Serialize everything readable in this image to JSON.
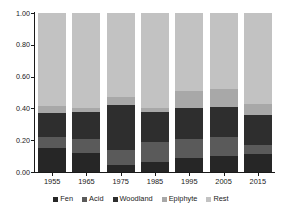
{
  "chart_data": {
    "type": "bar",
    "subtype": "stacked-bar-proportional",
    "title": "",
    "subtitle": "",
    "xlabel": "",
    "ylabel": "",
    "categories": [
      "1955",
      "1965",
      "1975",
      "1985",
      "1995",
      "2005",
      "2015"
    ],
    "xtick_labels": [
      "1955",
      "1965",
      "1975",
      "1985",
      "1995",
      "2005",
      "2015"
    ],
    "ytick_labels": [
      "0.00",
      "0.20",
      "0.40",
      "0.60",
      "0.80",
      "1.00"
    ],
    "ytick_values": [
      0.0,
      0.2,
      0.4,
      0.6,
      0.8,
      1.0
    ],
    "ylim": [
      0.0,
      1.0
    ],
    "grid": false,
    "legend_position": "bottom",
    "stack_order_bottom_to_top": [
      "Fen",
      "Acid",
      "Woodland",
      "Epiphyte",
      "Rest"
    ],
    "series": [
      {
        "name": "Fen",
        "color": "#262626",
        "values": [
          0.15,
          0.12,
          0.045,
          0.065,
          0.09,
          0.1,
          0.115
        ]
      },
      {
        "name": "Acid",
        "color": "#5a5a5a",
        "values": [
          0.07,
          0.09,
          0.095,
          0.125,
          0.12,
          0.12,
          0.055
        ]
      },
      {
        "name": "Woodland",
        "color": "#2e2e2e",
        "values": [
          0.15,
          0.17,
          0.28,
          0.19,
          0.19,
          0.19,
          0.19
        ]
      },
      {
        "name": "Epiphyte",
        "color": "#a8a8a8",
        "values": [
          0.045,
          0.025,
          0.05,
          0.025,
          0.11,
          0.11,
          0.065
        ]
      },
      {
        "name": "Rest",
        "color": "#c2c2c2",
        "values": [
          0.585,
          0.595,
          0.53,
          0.595,
          0.49,
          0.48,
          0.575
        ]
      }
    ]
  },
  "legend": {
    "items": [
      {
        "label": "Fen",
        "color": "#262626"
      },
      {
        "label": "Acid",
        "color": "#5a5a5a"
      },
      {
        "label": "Woodland",
        "color": "#2e2e2e"
      },
      {
        "label": "Epiphyte",
        "color": "#a8a8a8"
      },
      {
        "label": "Rest",
        "color": "#c2c2c2"
      }
    ]
  },
  "axes": {
    "y": {
      "labels": [
        "1.00",
        "0.80",
        "0.60",
        "0.40",
        "0.20",
        "0.00"
      ]
    },
    "x": {
      "labels": [
        "1955",
        "1965",
        "1975",
        "1985",
        "1995",
        "2005",
        "2015"
      ]
    }
  }
}
